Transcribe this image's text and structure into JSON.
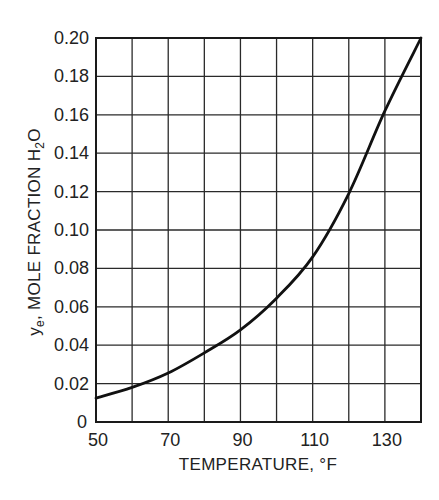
{
  "chart_data": {
    "type": "line",
    "title": "",
    "xlabel": "TEMPERATURE, °F",
    "ylabel": "y_e, MOLE FRACTION H2O",
    "ylabel_parts": {
      "symbol": "y",
      "symbol_sub": "e",
      "text": ", MOLE FRACTION H",
      "sub": "2",
      "tail": "O"
    },
    "xlim": [
      50,
      140
    ],
    "ylim": [
      0,
      0.2
    ],
    "x_ticks": [
      50,
      60,
      70,
      80,
      90,
      100,
      110,
      120,
      130,
      140
    ],
    "x_tick_labels": [
      "50",
      "",
      "70",
      "",
      "90",
      "",
      "110",
      "",
      "130",
      ""
    ],
    "y_ticks": [
      0,
      0.02,
      0.04,
      0.06,
      0.08,
      0.1,
      0.12,
      0.14,
      0.16,
      0.18,
      0.2
    ],
    "y_tick_labels": [
      "0",
      "0.02",
      "0.04",
      "0.06",
      "0.08",
      "0.10",
      "0.12",
      "0.14",
      "0.16",
      "0.18",
      "0.20"
    ],
    "grid": true,
    "legend": null,
    "series": [
      {
        "name": "equilibrium mole fraction H2O",
        "x": [
          50,
          60,
          70,
          80,
          90,
          100,
          110,
          120,
          130,
          140
        ],
        "values": [
          0.0125,
          0.018,
          0.0255,
          0.036,
          0.048,
          0.0645,
          0.086,
          0.119,
          0.162,
          0.2
        ]
      }
    ]
  }
}
